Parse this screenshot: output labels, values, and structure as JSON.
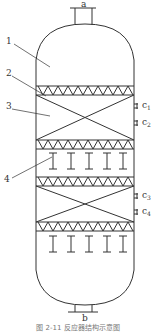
{
  "diagram": {
    "type": "reactor vessel schematic",
    "nozzles": [
      {
        "label": "a",
        "position": "top"
      },
      {
        "label": "b",
        "position": "bottom"
      }
    ],
    "callouts": [
      {
        "label": "1"
      },
      {
        "label": "2"
      },
      {
        "label": "3"
      },
      {
        "label": "4"
      }
    ],
    "side_ports": [
      {
        "base": "c",
        "sub": "1"
      },
      {
        "base": "c",
        "sub": "2"
      },
      {
        "base": "c",
        "sub": "3"
      },
      {
        "base": "c",
        "sub": "4"
      }
    ],
    "caption": "图 2-11  反应器结构示意图"
  }
}
